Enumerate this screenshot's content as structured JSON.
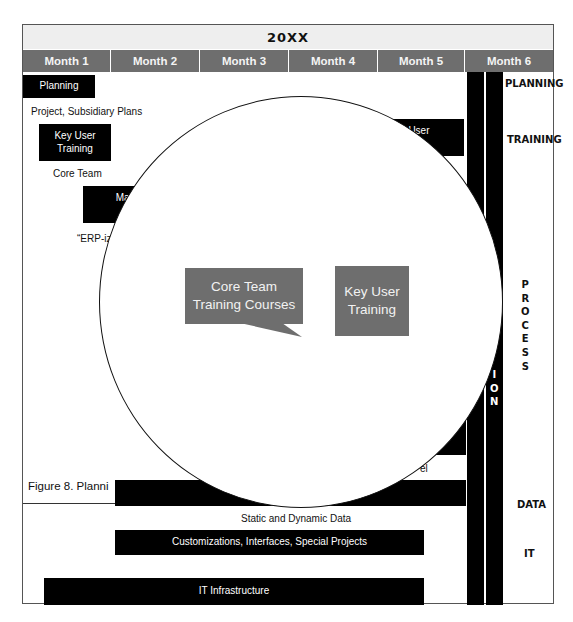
{
  "header": {
    "year": "20XX",
    "months": [
      "Month 1",
      "Month 2",
      "Month 3",
      "Month 4",
      "Month 5",
      "Month 6"
    ]
  },
  "timeline": {
    "planning_block": "Planning",
    "project_plans_label": "Project, Subsidiary Plans",
    "key_user_block": [
      "Key User",
      "Training"
    ],
    "core_team_label": "Core Team",
    "mapping_block": [
      "Mappi",
      "Proc"
    ],
    "erp_label": "“ERP-iz",
    "advanced_user_block": [
      "ed User",
      "ing"
    ],
    "model_fragment": "el",
    "static_dynamic_label": "Static and Dynamic Data",
    "customizations_block": "Customizations, Interfaces, Special Projects",
    "it_infrastructure_block": "IT Infrastructure"
  },
  "side_labels": {
    "planning": "PLANNING",
    "training": "TRAINING",
    "process": [
      "P",
      "R",
      "O",
      "C",
      "E",
      "S",
      "S"
    ],
    "data": "DATA",
    "it": "IT",
    "vertical_bar_fragment": [
      "I",
      "O",
      "N"
    ]
  },
  "magnifier": {
    "core_team_callout": [
      "Core Team",
      "Training Courses"
    ],
    "key_user_callout": [
      "Key User",
      "Training"
    ]
  },
  "caption": "Figure 8. Planni",
  "colors": {
    "month_header": "#6e6e6e",
    "year_header": "#eeeeee",
    "block": "#000000",
    "callout": "#6e6e6e"
  }
}
